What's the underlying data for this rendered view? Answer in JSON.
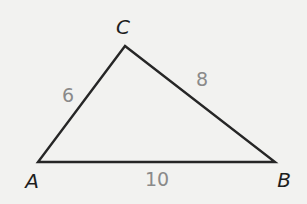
{
  "figure": {
    "type": "triangle-diagram",
    "colors": {
      "background": "#f2f2f0",
      "stroke": "#262626",
      "vertex_label": "#1e1e1e",
      "side_label": "#8a8a8a"
    },
    "vertices": {
      "a": {
        "label": "A"
      },
      "b": {
        "label": "B"
      },
      "c": {
        "label": "C"
      }
    },
    "sides": {
      "ac": {
        "from": "A",
        "to": "C",
        "length": "6"
      },
      "cb": {
        "from": "C",
        "to": "B",
        "length": "8"
      },
      "ab": {
        "from": "A",
        "to": "B",
        "length": "10"
      }
    }
  }
}
